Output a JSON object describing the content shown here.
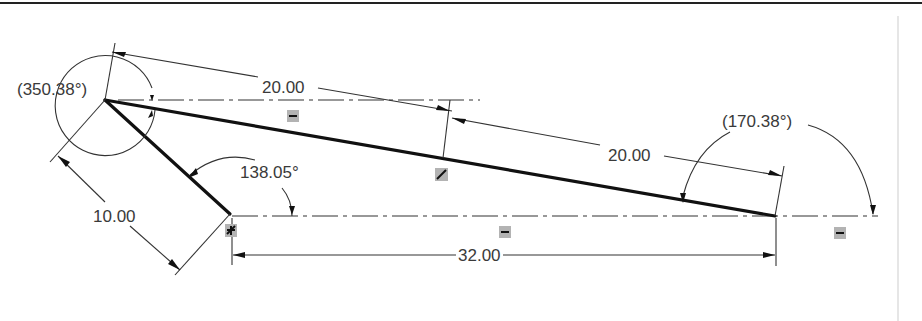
{
  "drawing": {
    "type": "2D sketch with dimensions",
    "colors": {
      "geometry": "#111111",
      "dimension": "#333333",
      "text": "#3a3a3a",
      "constraint_badge": "#b3b3b3",
      "background": "#ffffff"
    },
    "dimensions": {
      "top_length": "20.00",
      "slant_length": "20.00",
      "left_length": "10.00",
      "bottom_length": "32.00",
      "angle_bottom": "138.05°",
      "angle_left_ref": "(350.38°)",
      "angle_right_ref": "(170.38°)"
    },
    "constraints": [
      {
        "name": "horizontal-constraint",
        "glyph": "horizontal"
      },
      {
        "name": "parallel-constraint",
        "glyph": "slash"
      },
      {
        "name": "fixed-constraint",
        "glyph": "fix"
      },
      {
        "name": "horizontal-constraint",
        "glyph": "horizontal"
      },
      {
        "name": "horizontal-constraint",
        "glyph": "horizontal"
      }
    ]
  }
}
